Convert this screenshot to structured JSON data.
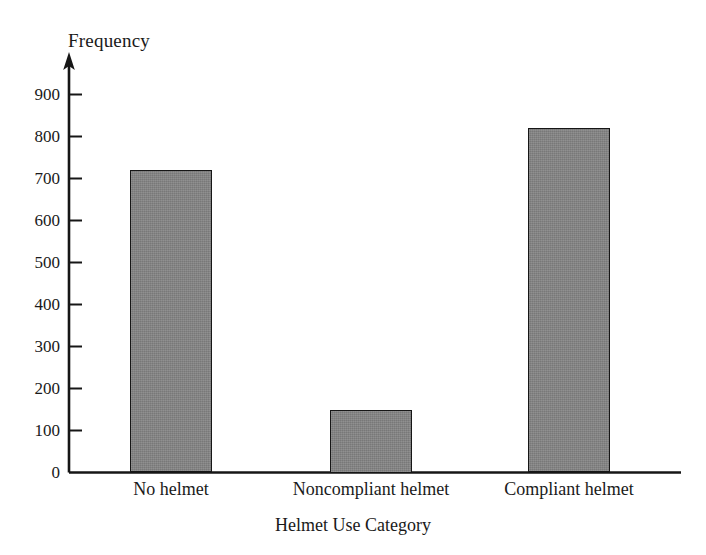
{
  "chart_data": {
    "type": "bar",
    "title": "",
    "subtitle": "",
    "xlabel": "Helmet Use Category",
    "ylabel": "Frequency",
    "categories": [
      "No helmet",
      "Noncompliant helmet",
      "Compliant helmet"
    ],
    "values": [
      720,
      150,
      820
    ],
    "ylim": [
      0,
      900
    ],
    "yticks": [
      0,
      100,
      200,
      300,
      400,
      500,
      600,
      700,
      800,
      900
    ],
    "ytick_labels": [
      "0",
      "100",
      "200",
      "300",
      "400",
      "500",
      "600",
      "700",
      "800",
      "900"
    ],
    "grid": false,
    "legend": false,
    "legend_position": "none",
    "bar_fill_color": "#848484",
    "bar_edge_color": "#161616",
    "axis_color": "#161616",
    "background_color": "#ffffff",
    "y_axis_has_arrow": true,
    "tick_direction": "inward"
  },
  "axes": {
    "y_title": "Frequency",
    "x_title": "Helmet Use Category"
  },
  "ticks": {
    "y": [
      {
        "label": "900",
        "value": 900
      },
      {
        "label": "800",
        "value": 800
      },
      {
        "label": "700",
        "value": 700
      },
      {
        "label": "600",
        "value": 600
      },
      {
        "label": "500",
        "value": 500
      },
      {
        "label": "400",
        "value": 400
      },
      {
        "label": "300",
        "value": 300
      },
      {
        "label": "200",
        "value": 200
      },
      {
        "label": "100",
        "value": 100
      },
      {
        "label": "0",
        "value": 0
      }
    ]
  },
  "bars": [
    {
      "label": "No helmet",
      "value": 720
    },
    {
      "label": "Noncompliant helmet",
      "value": 150
    },
    {
      "label": "Compliant helmet",
      "value": 820
    }
  ]
}
